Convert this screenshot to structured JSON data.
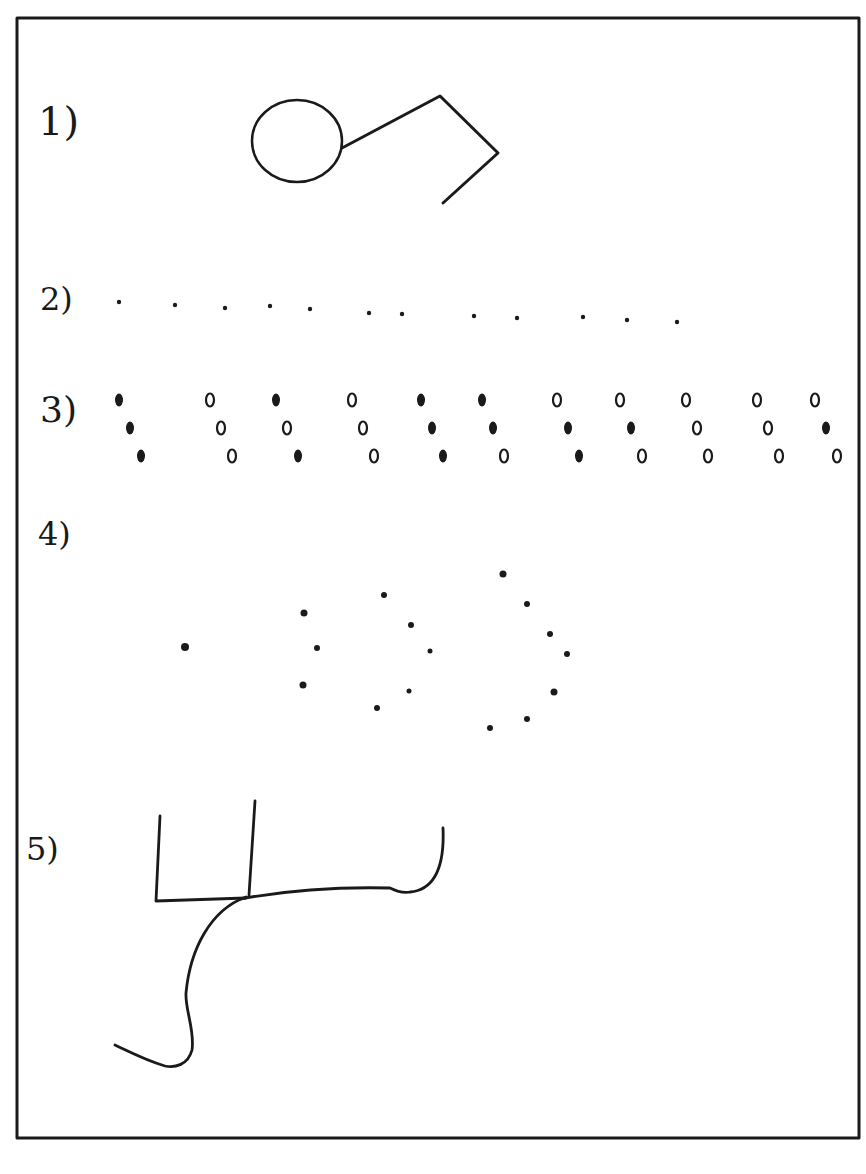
{
  "figure": {
    "frame": {
      "x": 17,
      "y": 18,
      "width": 842,
      "height": 1120,
      "stroke": "#1a1a1a"
    },
    "ink_color": "#1a1a1a",
    "background": "#ffffff"
  },
  "items": [
    {
      "label": "1)",
      "label_pos": {
        "x": 38,
        "y": 135
      },
      "description": "circle connected to a diamond (balloon / kite shape)",
      "shapes": {
        "circle": {
          "cx": 297,
          "cy": 141,
          "rx": 45,
          "ry": 41
        },
        "diamond_points": [
          [
            342,
            148
          ],
          [
            440,
            96
          ],
          [
            498,
            153
          ],
          [
            443,
            203
          ]
        ]
      }
    },
    {
      "label": "2)",
      "label_pos": {
        "x": 40,
        "y": 310
      },
      "description": "horizontal row of 12 small dots",
      "dots": [
        {
          "x": 119,
          "y": 302
        },
        {
          "x": 175,
          "y": 305
        },
        {
          "x": 225,
          "y": 308
        },
        {
          "x": 270,
          "y": 306
        },
        {
          "x": 310,
          "y": 309
        },
        {
          "x": 369,
          "y": 313
        },
        {
          "x": 402,
          "y": 314
        },
        {
          "x": 474,
          "y": 316
        },
        {
          "x": 517,
          "y": 318
        },
        {
          "x": 583,
          "y": 317
        },
        {
          "x": 627,
          "y": 320
        },
        {
          "x": 677,
          "y": 322
        }
      ]
    },
    {
      "label": "3)",
      "label_pos": {
        "x": 40,
        "y": 422
      },
      "description": "11 diagonal triplets of marks; filled (f) or open (o)",
      "triplets": [
        {
          "x": 119,
          "marks": [
            "f",
            "f",
            "f"
          ]
        },
        {
          "x": 210,
          "marks": [
            "o",
            "o",
            "o"
          ]
        },
        {
          "x": 276,
          "marks": [
            "f",
            "o",
            "f"
          ]
        },
        {
          "x": 352,
          "marks": [
            "o",
            "o",
            "o"
          ]
        },
        {
          "x": 421,
          "marks": [
            "f",
            "f",
            "f"
          ]
        },
        {
          "x": 482,
          "marks": [
            "f",
            "f",
            "o"
          ]
        },
        {
          "x": 557,
          "marks": [
            "o",
            "f",
            "f"
          ]
        },
        {
          "x": 620,
          "marks": [
            "o",
            "f",
            "o"
          ]
        },
        {
          "x": 686,
          "marks": [
            "o",
            "o",
            "o"
          ]
        },
        {
          "x": 757,
          "marks": [
            "o",
            "o",
            "o"
          ]
        },
        {
          "x": 815,
          "marks": [
            "o",
            "f",
            "o"
          ]
        }
      ]
    },
    {
      "label": "4)",
      "label_pos": {
        "x": 38,
        "y": 545
      },
      "description": "scattered dot pattern forming a single point and three nested arcs",
      "dots": [
        {
          "x": 185,
          "y": 647,
          "r": 4
        },
        {
          "x": 304,
          "y": 613,
          "r": 3.5
        },
        {
          "x": 317,
          "y": 648,
          "r": 3
        },
        {
          "x": 303,
          "y": 685,
          "r": 3.5
        },
        {
          "x": 384,
          "y": 595,
          "r": 3
        },
        {
          "x": 411,
          "y": 625,
          "r": 3
        },
        {
          "x": 430,
          "y": 651,
          "r": 2.5
        },
        {
          "x": 409,
          "y": 691,
          "r": 2.5
        },
        {
          "x": 377,
          "y": 708,
          "r": 3
        },
        {
          "x": 503,
          "y": 574,
          "r": 3.5
        },
        {
          "x": 527,
          "y": 604,
          "r": 3
        },
        {
          "x": 550,
          "y": 634,
          "r": 3
        },
        {
          "x": 567,
          "y": 654,
          "r": 3
        },
        {
          "x": 554,
          "y": 692,
          "r": 3.5
        },
        {
          "x": 527,
          "y": 719,
          "r": 3
        },
        {
          "x": 490,
          "y": 728,
          "r": 3
        }
      ]
    },
    {
      "label": "5)",
      "label_pos": {
        "x": 26,
        "y": 860
      },
      "description": "L-shaped line with a vertical stroke, a long curve to a hooked end, and an S-curve tail",
      "paths": [
        "M160 816 L156 901 L246 898",
        "M255 801 L249 895",
        "M240 899 C300 888 350 887 390 888 C400 893 405 893 410 892 C430 890 445 875 443 828",
        "M246 897 C210 910 190 950 186 993 C185 1010 195 1030 192 1050 C188 1065 175 1068 165 1066 C145 1060 130 1052 115 1045"
      ]
    }
  ]
}
